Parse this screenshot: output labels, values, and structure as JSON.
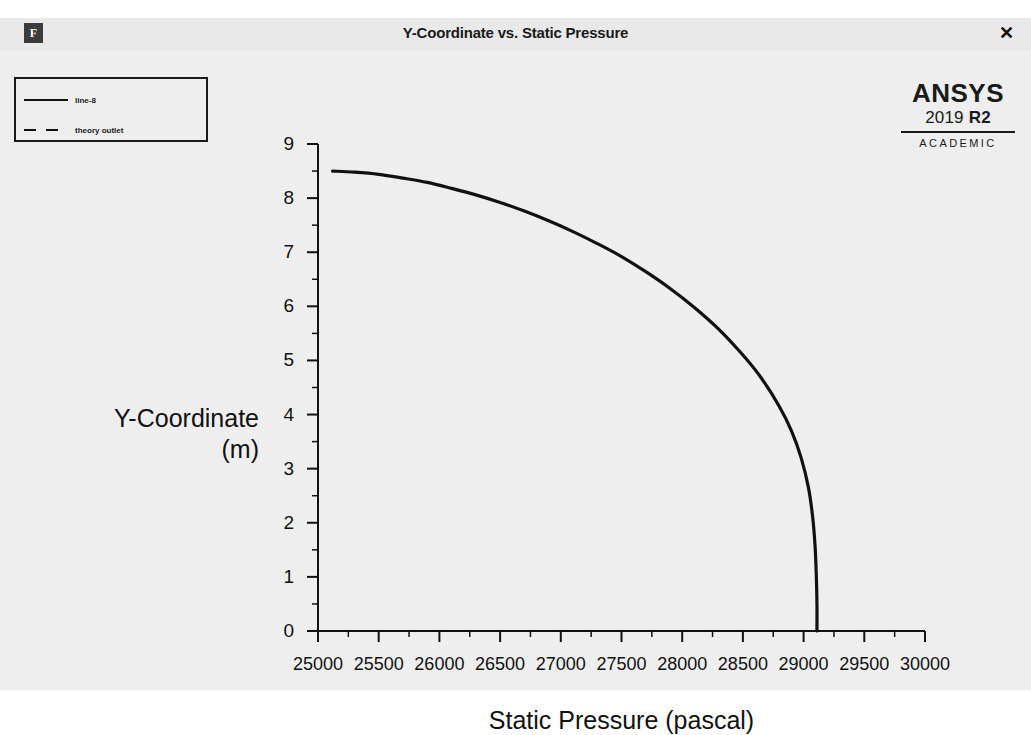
{
  "window": {
    "title": "Y-Coordinate vs. Static Pressure",
    "icon": "fluent-app-icon",
    "icon_glyph": "F",
    "close_label": "✕"
  },
  "brand": {
    "wordmark": "ANSYS",
    "release_year": "2019",
    "release_tag": "R2",
    "license": "ACADEMIC"
  },
  "legend": {
    "entries": [
      {
        "label": "line-8",
        "style": "solid"
      },
      {
        "label": "theory outlet",
        "style": "dashed"
      }
    ]
  },
  "chart_data": {
    "type": "line",
    "title": "Y-Coordinate vs. Static Pressure",
    "xlabel": "Static Pressure (pascal)",
    "ylabel": "Y-Coordinate\n(m)",
    "ylabel_line1": "Y-Coordinate",
    "ylabel_line2": "(m)",
    "xlim": [
      25000,
      30000
    ],
    "ylim": [
      0,
      9
    ],
    "xticks": [
      25000,
      25500,
      26000,
      26500,
      27000,
      27500,
      28000,
      28500,
      29000,
      29500,
      30000
    ],
    "xtick_labels": [
      "25000",
      "25500",
      "26000",
      "26500",
      "27000",
      "27500",
      "28000",
      "28500",
      "29000",
      "29500",
      "30000"
    ],
    "yticks": [
      0,
      1,
      2,
      3,
      4,
      5,
      6,
      7,
      8,
      9
    ],
    "ytick_labels": [
      "0",
      "1",
      "2",
      "3",
      "4",
      "5",
      "6",
      "7",
      "8",
      "9"
    ],
    "x_minor_step": 250,
    "y_minor_step": 0.5,
    "grid": false,
    "legend_position": "top-left",
    "series": [
      {
        "name": "line-8",
        "style": "solid",
        "color": "#111111",
        "points": [
          [
            25120,
            8.5
          ],
          [
            25300,
            8.48
          ],
          [
            25500,
            8.44
          ],
          [
            25700,
            8.37
          ],
          [
            25900,
            8.29
          ],
          [
            26100,
            8.18
          ],
          [
            26300,
            8.06
          ],
          [
            26500,
            7.92
          ],
          [
            26700,
            7.76
          ],
          [
            26900,
            7.58
          ],
          [
            27100,
            7.38
          ],
          [
            27300,
            7.16
          ],
          [
            27500,
            6.92
          ],
          [
            27700,
            6.64
          ],
          [
            27900,
            6.33
          ],
          [
            28100,
            5.98
          ],
          [
            28300,
            5.58
          ],
          [
            28500,
            5.1
          ],
          [
            28650,
            4.68
          ],
          [
            28800,
            4.15
          ],
          [
            28900,
            3.7
          ],
          [
            28980,
            3.2
          ],
          [
            29040,
            2.65
          ],
          [
            29075,
            2.1
          ],
          [
            29095,
            1.55
          ],
          [
            29105,
            1.0
          ],
          [
            29110,
            0.5
          ],
          [
            29110,
            0.0
          ]
        ]
      },
      {
        "name": "theory outlet",
        "style": "dashed",
        "color": "#111111",
        "points": []
      }
    ]
  }
}
